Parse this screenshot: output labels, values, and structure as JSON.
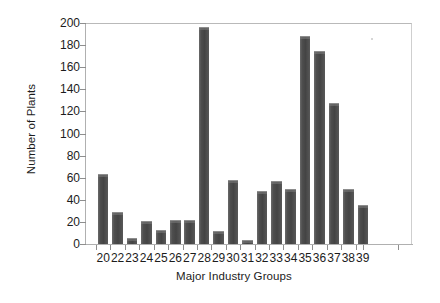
{
  "chart_data": {
    "type": "bar",
    "title": "",
    "xlabel": "Major Industry Groups",
    "ylabel": "Number of Plants",
    "categories": [
      "20",
      "22",
      "23",
      "24",
      "25",
      "26",
      "27",
      "28",
      "29",
      "30",
      "31",
      "32",
      "33",
      "34",
      "35",
      "36",
      "37",
      "38",
      "39"
    ],
    "values": [
      63,
      29,
      5,
      21,
      13,
      22,
      22,
      196,
      12,
      58,
      4,
      48,
      57,
      50,
      188,
      175,
      128,
      50,
      35
    ],
    "ylim": [
      0,
      200
    ],
    "ytick_values": [
      0,
      20,
      40,
      60,
      80,
      100,
      120,
      140,
      160,
      180,
      200
    ],
    "ytick_labels": [
      "0",
      "20",
      "40",
      "60",
      "80",
      "100",
      "120",
      "140",
      "160",
      "180",
      "200"
    ],
    "grid": false,
    "legend": "none",
    "bar_color": "#4e4e4e",
    "axis_color": "#b0b0b0",
    "text_color": "#1c1c1c"
  }
}
